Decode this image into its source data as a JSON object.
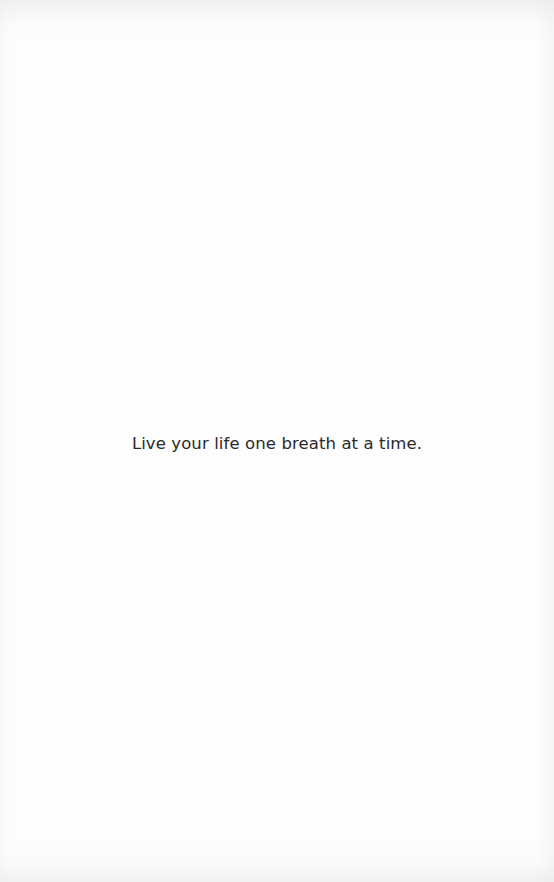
{
  "page": {
    "quote": "Live your life one breath at a time."
  },
  "colors": {
    "background": "#fdfdfd",
    "text": "#2a2a2a"
  }
}
